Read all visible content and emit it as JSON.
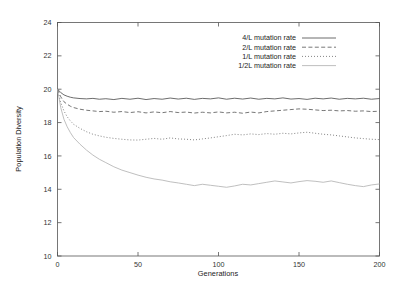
{
  "chart_data": {
    "type": "line",
    "title": "",
    "xlabel": "Generations",
    "ylabel": "Population Diversity",
    "xlim": [
      0,
      200
    ],
    "ylim": [
      10,
      24
    ],
    "xticks": [
      0,
      50,
      100,
      150,
      200
    ],
    "yticks": [
      10,
      12,
      14,
      16,
      18,
      20,
      22,
      24
    ],
    "grid": false,
    "legend_position": "top-right-inside",
    "series": [
      {
        "name": "4/L mutation rate",
        "style": "solid",
        "color": "#3c3c3c",
        "x": [
          0,
          2,
          4,
          6,
          8,
          10,
          14,
          18,
          22,
          26,
          30,
          35,
          40,
          45,
          50,
          55,
          60,
          65,
          70,
          75,
          80,
          85,
          90,
          95,
          100,
          105,
          110,
          115,
          120,
          125,
          130,
          135,
          140,
          145,
          150,
          155,
          160,
          165,
          170,
          175,
          180,
          185,
          190,
          195,
          200
        ],
        "values": [
          20.0,
          19.8,
          19.66,
          19.58,
          19.52,
          19.48,
          19.44,
          19.42,
          19.45,
          19.4,
          19.43,
          19.38,
          19.45,
          19.4,
          19.46,
          19.38,
          19.44,
          19.4,
          19.47,
          19.41,
          19.46,
          19.39,
          19.45,
          19.42,
          19.48,
          19.4,
          19.46,
          19.41,
          19.47,
          19.4,
          19.45,
          19.42,
          19.48,
          19.41,
          19.44,
          19.39,
          19.46,
          19.42,
          19.47,
          19.4,
          19.45,
          19.42,
          19.46,
          19.4,
          19.44
        ]
      },
      {
        "name": "2/L mutation rate",
        "style": "dashed",
        "color": "#4a4a4a",
        "x": [
          0,
          2,
          4,
          6,
          8,
          10,
          14,
          18,
          22,
          26,
          30,
          35,
          40,
          45,
          50,
          55,
          60,
          65,
          70,
          75,
          80,
          85,
          90,
          95,
          100,
          105,
          110,
          115,
          120,
          125,
          130,
          135,
          140,
          145,
          150,
          155,
          160,
          165,
          170,
          175,
          180,
          185,
          190,
          195,
          200
        ],
        "values": [
          20.0,
          19.55,
          19.25,
          19.1,
          18.98,
          18.9,
          18.8,
          18.74,
          18.7,
          18.66,
          18.68,
          18.62,
          18.66,
          18.6,
          18.65,
          18.58,
          18.64,
          18.59,
          18.66,
          18.6,
          18.63,
          18.57,
          18.62,
          18.58,
          18.64,
          18.58,
          18.62,
          18.56,
          18.63,
          18.58,
          18.66,
          18.7,
          18.74,
          18.78,
          18.82,
          18.8,
          18.76,
          18.72,
          18.74,
          18.7,
          18.72,
          18.68,
          18.7,
          18.66,
          18.68
        ]
      },
      {
        "name": "1/L mutation rate",
        "style": "dotted",
        "color": "#6e6e6e",
        "x": [
          0,
          2,
          4,
          6,
          8,
          10,
          14,
          18,
          22,
          26,
          30,
          35,
          40,
          45,
          50,
          55,
          60,
          65,
          70,
          75,
          80,
          85,
          90,
          95,
          100,
          105,
          110,
          115,
          120,
          125,
          130,
          135,
          140,
          145,
          150,
          155,
          160,
          165,
          170,
          175,
          180,
          185,
          190,
          195,
          200
        ],
        "values": [
          20.0,
          19.2,
          18.7,
          18.35,
          18.1,
          17.9,
          17.65,
          17.45,
          17.3,
          17.2,
          17.12,
          17.05,
          17.0,
          16.96,
          16.95,
          17.0,
          17.05,
          17.0,
          17.08,
          17.02,
          17.0,
          16.96,
          17.02,
          17.08,
          17.15,
          17.22,
          17.3,
          17.26,
          17.32,
          17.28,
          17.34,
          17.3,
          17.36,
          17.32,
          17.38,
          17.42,
          17.36,
          17.3,
          17.26,
          17.2,
          17.14,
          17.08,
          17.04,
          17.0,
          16.98
        ]
      },
      {
        "name": "1/2L mutation rate",
        "style": "faint",
        "color": "#b4b4b4",
        "x": [
          0,
          2,
          4,
          6,
          8,
          10,
          14,
          18,
          22,
          26,
          30,
          35,
          40,
          45,
          50,
          55,
          60,
          65,
          70,
          75,
          80,
          85,
          90,
          95,
          100,
          105,
          110,
          115,
          120,
          125,
          130,
          135,
          140,
          145,
          150,
          155,
          160,
          165,
          170,
          175,
          180,
          185,
          190,
          195,
          200
        ],
        "values": [
          20.0,
          18.9,
          18.2,
          17.75,
          17.4,
          17.1,
          16.7,
          16.35,
          16.05,
          15.8,
          15.6,
          15.35,
          15.15,
          15.0,
          14.85,
          14.72,
          14.62,
          14.55,
          14.45,
          14.38,
          14.3,
          14.22,
          14.3,
          14.24,
          14.18,
          14.12,
          14.2,
          14.3,
          14.26,
          14.34,
          14.42,
          14.5,
          14.44,
          14.38,
          14.46,
          14.52,
          14.48,
          14.42,
          14.5,
          14.4,
          14.3,
          14.22,
          14.16,
          14.26,
          14.32
        ]
      }
    ]
  },
  "legend": {
    "entries": [
      {
        "label": "4/L mutation rate"
      },
      {
        "label": "2/L mutation rate"
      },
      {
        "label": "1/L mutation rate"
      },
      {
        "label": "1/2L mutation rate"
      }
    ]
  }
}
